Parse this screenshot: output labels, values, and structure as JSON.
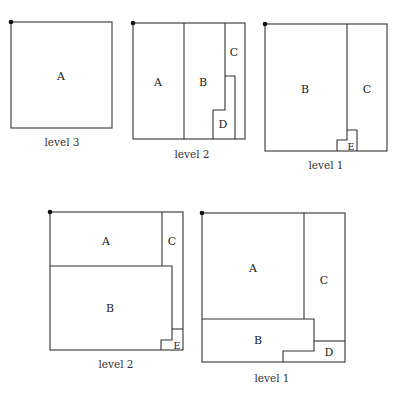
{
  "diagrams": [
    {
      "caption": "level 3",
      "regions": [
        {
          "label": "A"
        }
      ]
    },
    {
      "caption": "level 2",
      "regions": [
        {
          "label": "A"
        },
        {
          "label": "B"
        },
        {
          "label": "C"
        },
        {
          "label": "D"
        }
      ]
    },
    {
      "caption": "level 1",
      "regions": [
        {
          "label": "B"
        },
        {
          "label": "C"
        },
        {
          "label": "E"
        }
      ]
    },
    {
      "caption": "level 2",
      "regions": [
        {
          "label": "A"
        },
        {
          "label": "C"
        },
        {
          "label": "B"
        },
        {
          "label": "E"
        }
      ]
    },
    {
      "caption": "level 1",
      "regions": [
        {
          "label": "A"
        },
        {
          "label": "C"
        },
        {
          "label": "B"
        },
        {
          "label": "D"
        }
      ]
    }
  ],
  "colors": {
    "line": "#333333",
    "background": "#ffffff"
  }
}
